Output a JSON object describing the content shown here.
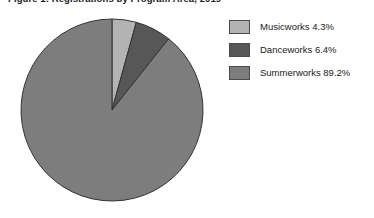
{
  "chart_data": {
    "type": "pie",
    "title": "Figure 1: Registrations by Program Area, 2019",
    "xlabel": "",
    "ylabel": "",
    "legend_position": "right",
    "grid": false,
    "start_angle_deg": 0,
    "direction": "clockwise",
    "categories": [
      "Musicworks",
      "Danceworks",
      "Summerworks"
    ],
    "values": [
      4.3,
      6.4,
      89.2
    ],
    "value_unit": "%",
    "slices": [
      {
        "label": "Musicworks",
        "value": 4.3,
        "legend_text": "Musicworks 4.3%",
        "color": "#b3b3b3",
        "start_deg": 0.0,
        "end_deg": 15.5
      },
      {
        "label": "Danceworks",
        "value": 6.4,
        "legend_text": "Danceworks 6.4%",
        "color": "#575757",
        "start_deg": 15.5,
        "end_deg": 38.5
      },
      {
        "label": "Summerworks",
        "value": 89.2,
        "legend_text": "Summerworks 89.2%",
        "color": "#7d7d7d",
        "start_deg": 38.5,
        "end_deg": 360.0
      }
    ],
    "geometry": {
      "center_x": 112,
      "center_y": 110,
      "radius": 91
    },
    "stroke_color": "#333333",
    "background_color": "#ffffff"
  },
  "legend": {
    "entries": [
      {
        "label": "Musicworks 4.3%",
        "swatch": "#b3b3b3"
      },
      {
        "label": "Danceworks 6.4%",
        "swatch": "#575757"
      },
      {
        "label": "Summerworks 89.2%",
        "swatch": "#7d7d7d"
      }
    ]
  }
}
